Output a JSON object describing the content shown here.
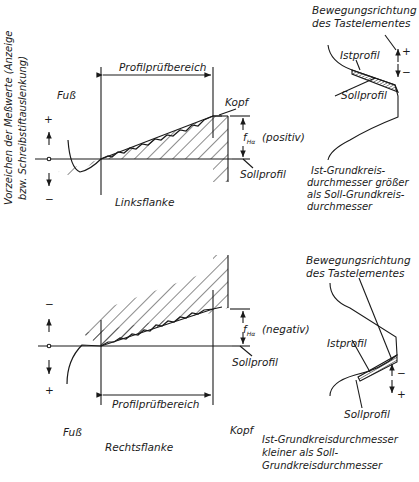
{
  "axis_label": {
    "line1": "Vorzeichen der Meßwerte (Anzeige",
    "line2": "bzw. Schreibstiftauslenkung)"
  },
  "top_diagram": {
    "title": "Linksflanke",
    "range_label": "Profilprüfbereich",
    "root_label": "Fuß",
    "tip_label": "Kopf",
    "deviation_symbol": "f",
    "deviation_subscript": "Hα",
    "deviation_sign": "(positiv)",
    "nominal_label": "Sollprofil",
    "sign_top": "+",
    "sign_bottom": "−"
  },
  "top_tooth": {
    "direction_label_line1": "Bewegungsrichtung",
    "direction_label_line2": "des Tastelementes",
    "actual_label": "Istprofil",
    "nominal_label": "Sollprofil",
    "sign_plus": "+",
    "sign_minus": "−",
    "caption_line1": "Ist-Grundkreis-",
    "caption_line2": "durchmesser größer",
    "caption_line3": "als Soll-Grundkreis-",
    "caption_line4": "durchmesser"
  },
  "bottom_diagram": {
    "title": "Rechtsflanke",
    "range_label": "Profilprüfbereich",
    "root_label": "Fuß",
    "tip_label": "Kopf",
    "deviation_symbol": "f",
    "deviation_subscript": "Hα",
    "deviation_sign": "(negativ)",
    "nominal_label": "Sollprofil",
    "sign_top": "−",
    "sign_bottom": "+"
  },
  "bottom_tooth": {
    "direction_label_line1": "Bewegungsrichtung",
    "direction_label_line2": "des Tastelementes",
    "actual_label": "Istprofil",
    "nominal_label": "Sollprofil",
    "sign_minus": "−",
    "sign_plus": "+",
    "caption_line1": "Ist-Grundkreisdurchmesser",
    "caption_line2": "kleiner als Soll-",
    "caption_line3": "Grundkreisdurchmesser"
  },
  "colors": {
    "ink": "#1a1a1a",
    "background": "#ffffff"
  }
}
